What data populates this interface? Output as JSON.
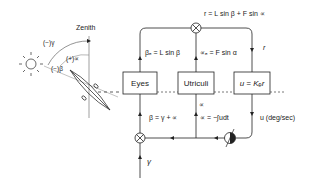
{
  "diagram": {
    "zenith_label": "Zenith",
    "angle_gamma_label": "(−)γ",
    "angle_alpha_label": "(+)∝",
    "angle_beta_label": "(−)β",
    "blocks": {
      "eyes": "Eyes",
      "utriculi": "Utriculi",
      "gain": "u = Kₑr"
    },
    "equations": {
      "r_eq": "r = L sin β + F sin ∝",
      "beta_e": "βₑ = L sin β",
      "alpha_e": "∝ₑ = F sin α",
      "r_label": "r",
      "beta_sum": "β = γ + ∝",
      "alpha_label": "∝",
      "alpha_int": "∝ = −∫udt",
      "u_label": "u (deg/sec)",
      "gamma_label": "γ"
    }
  }
}
